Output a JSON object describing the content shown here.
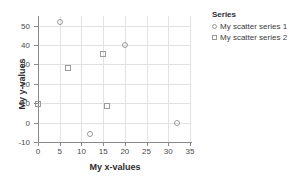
{
  "chart_data": {
    "type": "scatter",
    "title": "",
    "xlabel": "My x-values",
    "ylabel": "My y-values",
    "xlim": [
      0,
      35
    ],
    "ylim": [
      -10,
      55
    ],
    "xticks": [
      0,
      5,
      10,
      15,
      20,
      25,
      30,
      35
    ],
    "yticks": [
      -10,
      0,
      10,
      20,
      30,
      40,
      50
    ],
    "xtick_labels": [
      "0",
      "5",
      "10",
      "15",
      "20",
      "25",
      "30",
      "35"
    ],
    "ytick_labels": [
      "-10",
      "0",
      "10",
      "20",
      "30",
      "40",
      "50"
    ],
    "grid": true,
    "legend_position": "right",
    "legend_title": "Series",
    "series": [
      {
        "name": "My scatter series 1",
        "marker": "circle",
        "color": "#9a9a9a",
        "points": [
          {
            "x": 5,
            "y": 52
          },
          {
            "x": 20,
            "y": 40
          },
          {
            "x": 12,
            "y": -6
          },
          {
            "x": 32,
            "y": 0
          }
        ]
      },
      {
        "name": "My scatter series 2",
        "marker": "square",
        "color": "#9a9a9a",
        "points": [
          {
            "x": 0,
            "y": 9.5
          },
          {
            "x": 7,
            "y": 28
          },
          {
            "x": 15,
            "y": 35.5
          },
          {
            "x": 16,
            "y": 8.5
          }
        ]
      }
    ]
  },
  "colors": {
    "grid": "#e2e2e2",
    "axis": "#8a8a8a",
    "marker_stroke": "#9a9a9a",
    "text": "#3c3c3c",
    "background": "#ffffff"
  }
}
